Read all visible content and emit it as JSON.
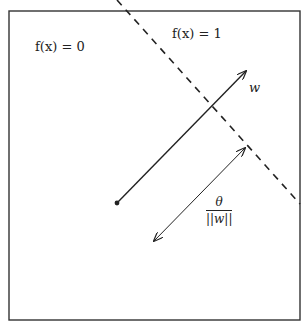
{
  "diagram": {
    "type": "perceptron-decision-boundary",
    "region_labels": {
      "left": "f(x) = 0",
      "right": "f(x) = 1"
    },
    "weight_vector_label": "w",
    "distance_label": {
      "numerator": "θ",
      "denominator": "||w||"
    },
    "colors": {
      "stroke": "#222222",
      "background": "#ffffff"
    }
  }
}
